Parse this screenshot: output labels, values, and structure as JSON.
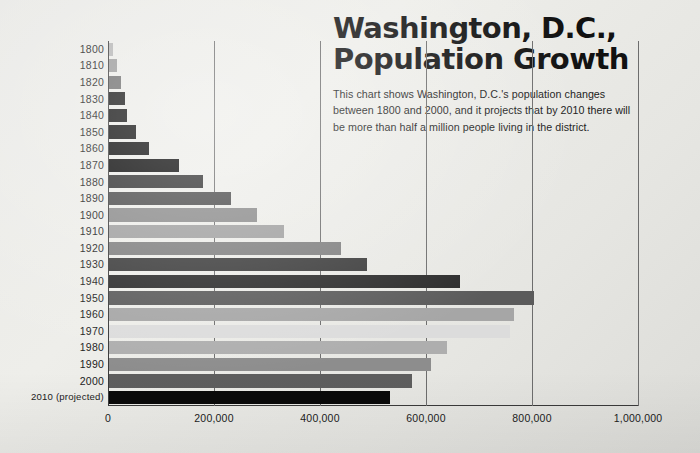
{
  "title": {
    "line1": "Washington, D.C.,",
    "line2": "Population Growth"
  },
  "description": "This chart shows Washington, D.C.'s population changes between 1800 and 2000, and it projects that by 2010 there will be more than half a million people living in the district.",
  "colors": {
    "background": "#ecece8",
    "text": "#1c1c1c",
    "axis": "#3a3a3a",
    "gridline": "#6d6d6d"
  },
  "chart_data": {
    "type": "bar",
    "orientation": "horizontal",
    "title": "Washington, D.C., Population Growth",
    "xlabel": "",
    "ylabel": "",
    "xlim": [
      0,
      1000000
    ],
    "grid": true,
    "legend": false,
    "xticks": [
      0,
      200000,
      400000,
      600000,
      800000,
      1000000
    ],
    "xtick_labels": [
      "0",
      "200,000",
      "400,000",
      "600,000",
      "800,000",
      "1,000,000"
    ],
    "categories": [
      "1800",
      "1810",
      "1820",
      "1830",
      "1840",
      "1850",
      "1860",
      "1870",
      "1880",
      "1890",
      "1900",
      "1910",
      "1920",
      "1930",
      "1940",
      "1950",
      "1960",
      "1970",
      "1980",
      "1990",
      "2000",
      "2010 (projected)"
    ],
    "values": [
      8000,
      16000,
      23000,
      30000,
      34000,
      51000,
      75000,
      132000,
      178000,
      230000,
      279000,
      331000,
      437000,
      487000,
      663000,
      802000,
      764000,
      757000,
      638000,
      607000,
      572000,
      530000
    ],
    "bar_colors": [
      "#b5b5b5",
      "#9a9a9a",
      "#6e6e6e",
      "#161616",
      "#111111",
      "#0d0d0d",
      "#0a0a0a",
      "#060606",
      "#2f2f2f",
      "#4a4a4a",
      "#8a8a8a",
      "#9f9f9f",
      "#7f7f7f",
      "#3b3b3b",
      "#2b2b2b",
      "#5b5b5b",
      "#a6a6a6",
      "#dcdcdc",
      "#aeaeae",
      "#8d8d8d",
      "#5e5e5e",
      "#0a0a0a"
    ]
  }
}
